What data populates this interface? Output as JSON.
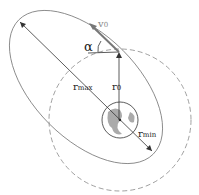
{
  "diagram": {
    "type": "orbital-geometry",
    "labels": {
      "v0": "v",
      "v0_sub": "0",
      "alpha": "α",
      "r0": "r",
      "r0_sub": "0",
      "rmax": "r",
      "rmax_sub": "max",
      "rmin": "r",
      "rmin_sub": "min"
    },
    "colors": {
      "line": "#555555",
      "dashed": "#888888",
      "planet_fill": "#bbbbbb",
      "velocity": "#777777"
    }
  }
}
